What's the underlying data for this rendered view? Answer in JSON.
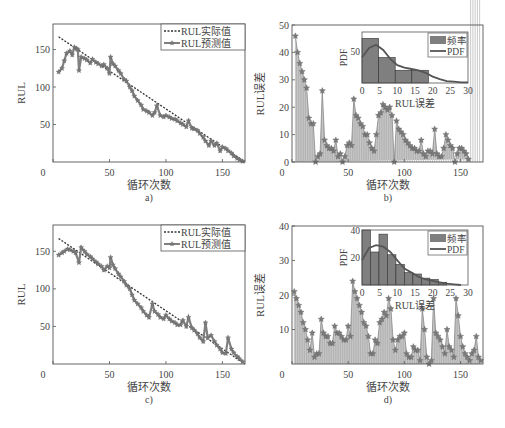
{
  "chart_data": [
    {
      "id": "a",
      "type": "line",
      "caption": "a)",
      "xlabel": "循环次数",
      "ylabel": "RUL",
      "xlim": [
        0,
        170
      ],
      "ylim": [
        0,
        184
      ],
      "xticks": [
        0,
        50,
        100,
        150
      ],
      "yticks": [
        50,
        100,
        150
      ],
      "legend": [
        "RUL实际值",
        "RUL预测值"
      ],
      "legend_position": "upper right",
      "series": [
        {
          "name": "RUL实际值",
          "style": "dotted",
          "x": [
            5,
            170
          ],
          "y": [
            167,
            0
          ]
        },
        {
          "name": "RUL预测值",
          "style": "solid-star",
          "x": [
            5,
            8,
            10,
            12,
            15,
            17,
            19,
            21,
            22,
            23,
            25,
            28,
            30,
            33,
            35,
            38,
            40,
            43,
            45,
            48,
            50,
            51,
            53,
            55,
            58,
            60,
            63,
            65,
            68,
            70,
            72,
            75,
            78,
            80,
            83,
            85,
            88,
            90,
            92,
            95,
            98,
            100,
            103,
            105,
            108,
            110,
            113,
            115,
            118,
            120,
            123,
            125,
            128,
            130,
            133,
            135,
            138,
            140,
            143,
            145,
            148,
            150,
            153,
            155,
            158,
            160,
            163,
            165,
            168
          ],
          "y": [
            120,
            125,
            135,
            145,
            148,
            143,
            153,
            151,
            150,
            122,
            140,
            138,
            136,
            132,
            137,
            133,
            131,
            128,
            130,
            125,
            118,
            140,
            131,
            128,
            122,
            118,
            110,
            108,
            100,
            95,
            88,
            82,
            76,
            70,
            68,
            66,
            62,
            66,
            75,
            62,
            60,
            62,
            60,
            58,
            57,
            55,
            52,
            50,
            47,
            55,
            45,
            44,
            42,
            38,
            33,
            28,
            22,
            28,
            22,
            25,
            15,
            20,
            18,
            15,
            12,
            8,
            5,
            3,
            1
          ]
        }
      ]
    },
    {
      "id": "b",
      "type": "bar",
      "caption": "b)",
      "xlabel": "循环次数",
      "ylabel": "RUL误差",
      "xlim": [
        0,
        170
      ],
      "ylim": [
        0,
        50
      ],
      "xticks": [
        0,
        50,
        100,
        150
      ],
      "yticks": [
        0,
        10,
        20,
        30,
        40,
        50
      ],
      "x": [
        3,
        5,
        7,
        9,
        11,
        13,
        15,
        17,
        19,
        21,
        23,
        25,
        27,
        29,
        31,
        33,
        35,
        37,
        39,
        41,
        43,
        45,
        47,
        49,
        51,
        53,
        55,
        57,
        59,
        61,
        63,
        65,
        67,
        69,
        71,
        73,
        75,
        77,
        79,
        81,
        83,
        85,
        87,
        89,
        91,
        93,
        95,
        97,
        99,
        101,
        103,
        105,
        107,
        109,
        111,
        113,
        115,
        117,
        119,
        121,
        123,
        125,
        127,
        129,
        131,
        133,
        135,
        137,
        139,
        141,
        143,
        145,
        147,
        149,
        151,
        153,
        155,
        157,
        159,
        161,
        163,
        165,
        167
      ],
      "values": [
        46,
        40,
        36,
        33,
        30,
        27,
        16,
        14,
        14,
        0,
        2,
        3,
        26,
        8,
        6,
        5,
        5,
        4,
        8,
        2,
        3,
        0,
        2,
        6,
        7,
        6,
        23,
        17,
        16,
        14,
        13,
        10,
        10,
        7,
        5,
        4,
        10,
        17,
        18,
        21,
        20,
        19,
        20,
        17,
        0,
        15,
        12,
        11,
        10,
        8,
        7,
        6,
        5,
        5,
        4,
        4,
        8,
        3,
        2,
        4,
        4,
        3,
        12,
        3,
        2,
        2,
        5,
        10,
        8,
        6,
        5,
        0,
        3,
        5,
        5,
        4,
        3,
        1
      ],
      "inset": {
        "type": "histogram",
        "xlabel": "RUL误差",
        "ylabel": "PDF",
        "xlim": [
          0,
          30
        ],
        "ylim": [
          0,
          80
        ],
        "xticks": [
          0,
          5,
          10,
          15,
          20,
          25,
          30
        ],
        "yticks": [
          50
        ],
        "legend": [
          "频率",
          "PDF"
        ],
        "bin_edges": [
          0,
          4.7,
          9.4,
          14.1,
          18.8
        ],
        "frequencies": [
          70,
          40,
          20,
          20
        ],
        "pdf_x": [
          0,
          2,
          4,
          6,
          8,
          10,
          12,
          14,
          16,
          18,
          20,
          22,
          24,
          26,
          28,
          30
        ],
        "pdf_y": [
          40,
          55,
          60,
          52,
          38,
          28,
          24,
          22,
          20,
          16,
          10,
          6,
          3,
          2,
          1,
          1
        ]
      }
    },
    {
      "id": "c",
      "type": "line",
      "caption": "c)",
      "xlabel": "循环次数",
      "ylabel": "RUL",
      "xlim": [
        0,
        170
      ],
      "ylim": [
        0,
        185
      ],
      "xticks": [
        0,
        50,
        100,
        150
      ],
      "yticks": [
        50,
        100,
        150
      ],
      "legend": [
        "RUL实际值",
        "RUL预测值"
      ],
      "legend_position": "upper right",
      "series": [
        {
          "name": "RUL实际值",
          "style": "dotted",
          "x": [
            5,
            170
          ],
          "y": [
            167,
            0
          ]
        },
        {
          "name": "RUL预测值",
          "style": "solid-star",
          "x": [
            5,
            8,
            10,
            13,
            15,
            18,
            20,
            23,
            25,
            28,
            30,
            33,
            35,
            38,
            40,
            43,
            45,
            48,
            50,
            51,
            53,
            55,
            58,
            60,
            63,
            65,
            68,
            70,
            72,
            75,
            78,
            80,
            83,
            85,
            88,
            90,
            93,
            95,
            98,
            100,
            103,
            105,
            108,
            110,
            113,
            115,
            118,
            120,
            123,
            125,
            128,
            130,
            133,
            135,
            137,
            140,
            143,
            145,
            148,
            150,
            153,
            155,
            158,
            160,
            163,
            165,
            168
          ],
          "y": [
            145,
            148,
            150,
            153,
            152,
            150,
            148,
            135,
            155,
            150,
            146,
            143,
            140,
            136,
            133,
            130,
            125,
            130,
            128,
            142,
            132,
            127,
            120,
            116,
            110,
            105,
            100,
            92,
            85,
            80,
            75,
            70,
            65,
            62,
            80,
            70,
            66,
            62,
            60,
            65,
            60,
            57,
            55,
            52,
            52,
            58,
            50,
            62,
            48,
            45,
            40,
            35,
            30,
            55,
            35,
            38,
            30,
            25,
            20,
            15,
            14,
            35,
            20,
            15,
            10,
            7,
            3
          ]
        }
      ]
    },
    {
      "id": "d",
      "type": "bar",
      "caption": "d)",
      "xlabel": "循环次数",
      "ylabel": "RUL误差",
      "xlim": [
        0,
        170
      ],
      "ylim": [
        0,
        40
      ],
      "xticks": [
        0,
        50,
        100,
        150
      ],
      "yticks": [
        10,
        20,
        30,
        40
      ],
      "x": [
        2,
        4,
        6,
        8,
        10,
        12,
        14,
        16,
        18,
        20,
        22,
        24,
        26,
        28,
        30,
        32,
        34,
        36,
        38,
        40,
        42,
        44,
        46,
        48,
        50,
        52,
        54,
        56,
        58,
        60,
        62,
        64,
        66,
        68,
        70,
        72,
        74,
        76,
        78,
        80,
        82,
        84,
        86,
        88,
        90,
        92,
        94,
        96,
        98,
        100,
        102,
        104,
        106,
        108,
        110,
        112,
        114,
        116,
        118,
        120,
        122,
        124,
        126,
        128,
        130,
        132,
        134,
        136,
        138,
        140,
        142,
        144,
        146,
        148,
        150,
        152,
        154,
        156,
        158,
        160,
        162,
        164,
        166,
        168
      ],
      "values": [
        21,
        19,
        17,
        15,
        12,
        10,
        7,
        4,
        9,
        2,
        3,
        3,
        13,
        9,
        8,
        8,
        6,
        6,
        11,
        9,
        9,
        8,
        7,
        7,
        11,
        8,
        24,
        21,
        19,
        17,
        15,
        12,
        11,
        8,
        3,
        3,
        7,
        6,
        12,
        13,
        15,
        14,
        19,
        16,
        7,
        4,
        7,
        8,
        8,
        9,
        3,
        2,
        2,
        5,
        4,
        4,
        1,
        16,
        10,
        2,
        0,
        1,
        19,
        9,
        8,
        7,
        5,
        3,
        10,
        5,
        4,
        2,
        19,
        14,
        8,
        5,
        3,
        2,
        1,
        3,
        4,
        8,
        2,
        1
      ],
      "inset": {
        "type": "histogram",
        "xlabel": "RUL误差",
        "ylabel": "PDF",
        "xlim": [
          0,
          30
        ],
        "ylim": [
          0,
          40
        ],
        "xticks": [
          0,
          5,
          10,
          15,
          20,
          25,
          30
        ],
        "yticks": [
          20,
          40
        ],
        "legend": [
          "频率",
          "PDF"
        ],
        "bin_edges": [
          0,
          2.4,
          4.8,
          7.2,
          9.6,
          12,
          14.4,
          16.8,
          19.2,
          21.6,
          24
        ],
        "frequencies": [
          40,
          24,
          37,
          22,
          15,
          9,
          8,
          5,
          4,
          2
        ],
        "pdf_x": [
          0,
          2,
          4,
          6,
          8,
          10,
          12,
          14,
          16,
          18,
          20,
          22,
          24,
          26,
          28
        ],
        "pdf_y": [
          18,
          27,
          29,
          28,
          24,
          18,
          12,
          9,
          6,
          4,
          3,
          2,
          1,
          0.5,
          0
        ]
      }
    }
  ]
}
